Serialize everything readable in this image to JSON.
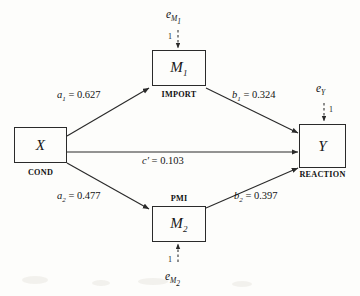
{
  "diagram": {
    "type": "statistical-mediation-path-diagram",
    "nodes": [
      {
        "id": "x",
        "variable": "X",
        "caption": "COND",
        "caption_position": "below"
      },
      {
        "id": "m1",
        "variable": "M",
        "subscript": "1",
        "caption": "IMPORT",
        "caption_position": "below"
      },
      {
        "id": "m2",
        "variable": "M",
        "subscript": "2",
        "caption": "PMI",
        "caption_position": "above"
      },
      {
        "id": "y",
        "variable": "Y",
        "caption": "REACTION",
        "caption_position": "below"
      }
    ],
    "paths": [
      {
        "id": "a1",
        "from": "x",
        "to": "m1",
        "coefficient": "a",
        "subscript": "1",
        "equals": "=",
        "value": "0.627",
        "label": "a1 = 0.627"
      },
      {
        "id": "b1",
        "from": "m1",
        "to": "y",
        "coefficient": "b",
        "subscript": "1",
        "equals": "=",
        "value": "0.324",
        "label": "b1 = 0.324"
      },
      {
        "id": "cprime",
        "from": "x",
        "to": "y",
        "coefficient": "c′",
        "subscript": "",
        "equals": "=",
        "value": "0.103",
        "label": "c′ = 0.103"
      },
      {
        "id": "a2",
        "from": "x",
        "to": "m2",
        "coefficient": "a",
        "subscript": "2",
        "equals": "=",
        "value": "0.477",
        "label": "a2 = 0.477"
      },
      {
        "id": "b2",
        "from": "m2",
        "to": "y",
        "coefficient": "b",
        "subscript": "2",
        "equals": "=",
        "value": "0.397",
        "label": "b2 = 0.397"
      }
    ],
    "errors": [
      {
        "id": "e_m1",
        "symbol": "e",
        "subscript": "M₁",
        "sub_base": "M",
        "sub_index": "1",
        "target": "m1",
        "loading": "1",
        "direction": "down"
      },
      {
        "id": "e_y",
        "symbol": "e",
        "subscript": "Y",
        "sub_base": "Y",
        "sub_index": "",
        "target": "y",
        "loading": "1",
        "direction": "down"
      },
      {
        "id": "e_m2",
        "symbol": "e",
        "subscript": "M₂",
        "sub_base": "M",
        "sub_index": "2",
        "target": "m2",
        "loading": "1",
        "direction": "up"
      }
    ],
    "colors": {
      "stroke": "#2a2a2a",
      "text": "#141414",
      "background": "#fdfdfb"
    }
  }
}
